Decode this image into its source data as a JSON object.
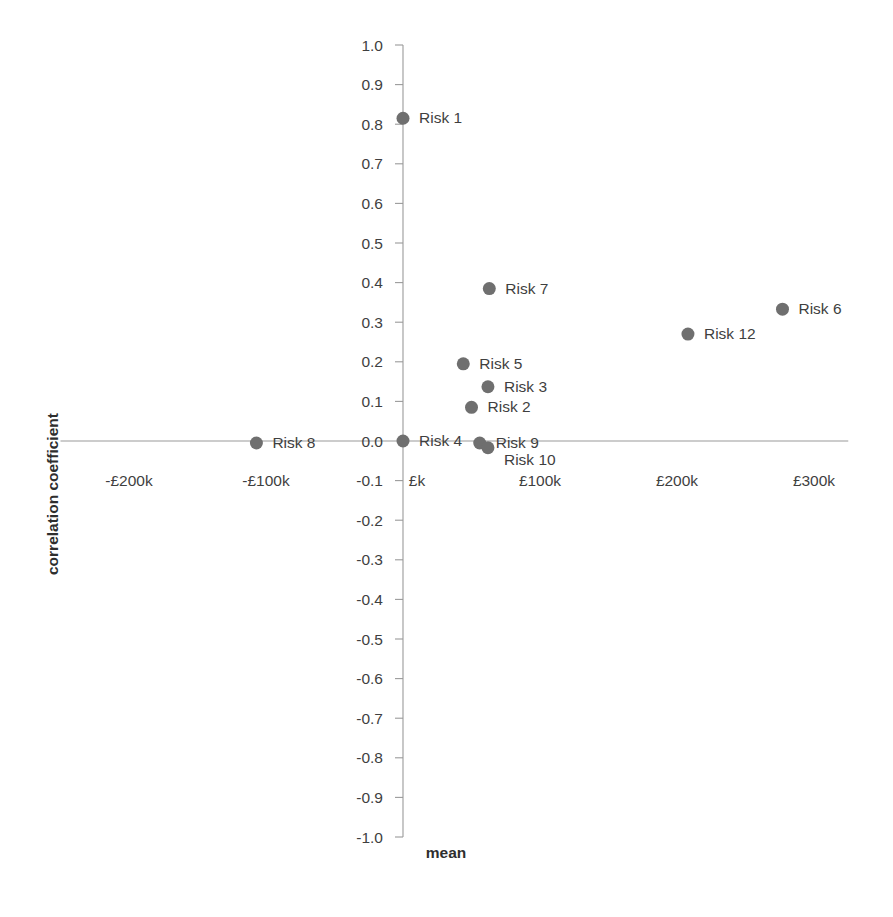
{
  "chart_data": {
    "type": "scatter",
    "title": "",
    "xlabel": "mean",
    "ylabel": "correlation coefficient",
    "xlim": [
      -250000,
      325000
    ],
    "ylim": [
      -1.0,
      1.0
    ],
    "grid": false,
    "legend": "none",
    "x_tick_labels": [
      "-£200k",
      "-£100k",
      "£k",
      "£100k",
      "£200k",
      "£300k"
    ],
    "x_tick_values": [
      -200000,
      -100000,
      0,
      100000,
      200000,
      300000
    ],
    "y_tick_labels": [
      "1.0",
      "0.9",
      "0.8",
      "0.7",
      "0.6",
      "0.5",
      "0.4",
      "0.3",
      "0.2",
      "0.1",
      "0.0",
      "-0.1",
      "-0.2",
      "-0.3",
      "-0.4",
      "-0.5",
      "-0.6",
      "-0.7",
      "-0.8",
      "-0.9",
      "-1.0"
    ],
    "y_tick_values": [
      1.0,
      0.9,
      0.8,
      0.7,
      0.6,
      0.5,
      0.4,
      0.3,
      0.2,
      0.1,
      0.0,
      -0.1,
      -0.2,
      -0.3,
      -0.4,
      -0.5,
      -0.6,
      -0.7,
      -0.8,
      -0.9,
      -1.0
    ],
    "marker_color": "#6f6f6f",
    "axis_color": "#9a9a9a",
    "points": [
      {
        "label": "Risk 1",
        "x": 0,
        "y": 0.815
      },
      {
        "label": "Risk 7",
        "x": 63000,
        "y": 0.385
      },
      {
        "label": "Risk 6",
        "x": 277000,
        "y": 0.333
      },
      {
        "label": "Risk 12",
        "x": 208000,
        "y": 0.27
      },
      {
        "label": "Risk 5",
        "x": 44000,
        "y": 0.195
      },
      {
        "label": "Risk 3",
        "x": 62000,
        "y": 0.137
      },
      {
        "label": "Risk 2",
        "x": 50000,
        "y": 0.085
      },
      {
        "label": "Risk 8",
        "x": -107000,
        "y": -0.005
      },
      {
        "label": "Risk 4",
        "x": 0,
        "y": 0.0
      },
      {
        "label": "Risk 9",
        "x": 56000,
        "y": -0.005
      },
      {
        "label": "Risk 10",
        "x": 62000,
        "y": -0.017
      }
    ],
    "label_offsets": [
      {
        "label": "Risk 1",
        "dx": 16,
        "dy": 5
      },
      {
        "label": "Risk 7",
        "dx": 16,
        "dy": 5
      },
      {
        "label": "Risk 6",
        "dx": 16,
        "dy": 5
      },
      {
        "label": "Risk 12",
        "dx": 16,
        "dy": 5
      },
      {
        "label": "Risk 5",
        "dx": 16,
        "dy": 5
      },
      {
        "label": "Risk 3",
        "dx": 16,
        "dy": 5
      },
      {
        "label": "Risk 2",
        "dx": 16,
        "dy": 5
      },
      {
        "label": "Risk 8",
        "dx": 16,
        "dy": 5
      },
      {
        "label": "Risk 4",
        "dx": 16,
        "dy": 5
      },
      {
        "label": "Risk 9",
        "dx": 16,
        "dy": 5
      },
      {
        "label": "Risk 10",
        "dx": 16,
        "dy": 17
      }
    ]
  }
}
